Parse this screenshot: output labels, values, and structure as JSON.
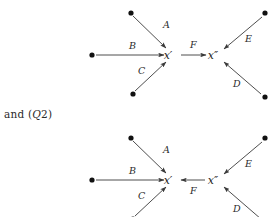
{
  "canvas": {
    "width": 277,
    "height": 217,
    "background": "#ffffff"
  },
  "style": {
    "line_color": "#3a3a3a",
    "dot_color": "#111111",
    "text_color": "#1a1a1a",
    "label_color": "#2b2b2b"
  },
  "connector": {
    "prefix": "and (",
    "italic_symbol": "Q",
    "suffix": "2)",
    "full_text": "and (Q2)"
  },
  "diagrams": [
    {
      "id": "q1",
      "name": "diagram-upper",
      "nodes": [
        {
          "id": "d-top-left",
          "label": "",
          "x": 131,
          "y": 13,
          "kind": "dot"
        },
        {
          "id": "d-mid-left",
          "label": "",
          "x": 92,
          "y": 55,
          "kind": "dot"
        },
        {
          "id": "d-bottom-left",
          "label": "",
          "x": 133,
          "y": 94,
          "kind": "dot"
        },
        {
          "id": "x-prime",
          "label": "x′",
          "x": 172,
          "y": 55,
          "kind": "label"
        },
        {
          "id": "x-double-prime",
          "label": "x″",
          "x": 214,
          "y": 55,
          "kind": "label"
        },
        {
          "id": "d-top-right",
          "label": "",
          "x": 265,
          "y": 13,
          "kind": "dot"
        },
        {
          "id": "d-bottom-right",
          "label": "",
          "x": 265,
          "y": 97,
          "kind": "dot"
        }
      ],
      "edges": [
        {
          "id": "edge-a",
          "label": "A",
          "from": "d-top-left",
          "to": "x-prime",
          "label_x": 163,
          "label_y": 28,
          "direction": "down-right"
        },
        {
          "id": "edge-b",
          "label": "B",
          "from": "d-mid-left",
          "to": "x-prime",
          "label_x": 129,
          "label_y": 49,
          "direction": "right"
        },
        {
          "id": "edge-c",
          "label": "C",
          "from": "d-bottom-left",
          "to": "x-prime",
          "label_x": 141,
          "label_y": 73,
          "direction": "up-right"
        },
        {
          "id": "edge-f",
          "label": "F",
          "from": "x-prime",
          "to": "x-double-prime",
          "label_x": 192,
          "label_y": 48,
          "direction": "right"
        },
        {
          "id": "edge-e",
          "label": "E",
          "from": "d-top-right",
          "to": "x-double-prime",
          "label_x": 247,
          "label_y": 41,
          "direction": "down-left"
        },
        {
          "id": "edge-d",
          "label": "D",
          "from": "d-bottom-right",
          "to": "x-double-prime",
          "label_x": 235,
          "label_y": 85,
          "direction": "up-left"
        }
      ]
    },
    {
      "id": "q2",
      "name": "diagram-lower",
      "nodes": [
        {
          "id": "d-top-left2",
          "label": "",
          "x": 131,
          "y": 138,
          "kind": "dot"
        },
        {
          "id": "d-mid-left2",
          "label": "",
          "x": 92,
          "y": 180,
          "kind": "dot"
        },
        {
          "id": "d-bottom-left2",
          "label": "",
          "x": 133,
          "y": 219,
          "kind": "dot"
        },
        {
          "id": "x-prime2",
          "label": "x′",
          "x": 172,
          "y": 180,
          "kind": "label"
        },
        {
          "id": "x-double-prime2",
          "label": "x″",
          "x": 214,
          "y": 180,
          "kind": "label"
        },
        {
          "id": "d-top-right2",
          "label": "",
          "x": 265,
          "y": 138,
          "kind": "dot"
        },
        {
          "id": "d-bottom-right2",
          "label": "",
          "x": 265,
          "y": 222,
          "kind": "dot"
        }
      ],
      "edges": [
        {
          "id": "edge-a2",
          "label": "A",
          "from": "d-top-left2",
          "to": "x-prime2",
          "label_x": 163,
          "label_y": 153,
          "direction": "down-right"
        },
        {
          "id": "edge-b2",
          "label": "B",
          "from": "d-mid-left2",
          "to": "x-prime2",
          "label_x": 129,
          "label_y": 174,
          "direction": "right"
        },
        {
          "id": "edge-c2",
          "label": "C",
          "from": "d-bottom-left2",
          "to": "x-prime2",
          "label_x": 141,
          "label_y": 198,
          "direction": "up-right"
        },
        {
          "id": "edge-f2",
          "label": "F",
          "from": "x-double-prime2",
          "to": "x-prime2",
          "label_x": 192,
          "label_y": 193,
          "direction": "left"
        },
        {
          "id": "edge-e2",
          "label": "E",
          "from": "d-top-right2",
          "to": "x-double-prime2",
          "label_x": 247,
          "label_y": 166,
          "direction": "down-left"
        },
        {
          "id": "edge-d2",
          "label": "D",
          "from": "d-bottom-right2",
          "to": "x-double-prime2",
          "label_x": 235,
          "label_y": 210,
          "direction": "up-left"
        }
      ]
    }
  ]
}
